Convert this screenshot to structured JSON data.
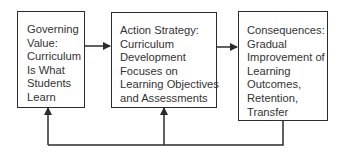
{
  "diagram": {
    "type": "flow-with-feedback",
    "boxes": [
      {
        "id": "governing-value",
        "lines": [
          "Governing",
          "Value:",
          "Curriculum",
          "Is What",
          "Students",
          "Learn"
        ]
      },
      {
        "id": "action-strategy",
        "lines": [
          "Action Strategy:",
          "Curriculum",
          "Development",
          "Focuses on",
          "Learning Objectives",
          "and Assessments"
        ]
      },
      {
        "id": "consequences",
        "lines": [
          "Consequences:",
          "Gradual",
          "Improvement of",
          "Learning",
          "Outcomes,",
          "Retention,",
          "Transfer"
        ]
      }
    ],
    "edges": [
      {
        "from": "governing-value",
        "to": "action-strategy"
      },
      {
        "from": "action-strategy",
        "to": "consequences"
      },
      {
        "from": "consequences",
        "to": "action-strategy",
        "kind": "feedback"
      },
      {
        "from": "consequences",
        "to": "governing-value",
        "kind": "feedback"
      }
    ],
    "colors": {
      "stroke": "#2b2b2b",
      "text": "#333333",
      "background": "#ffffff"
    }
  }
}
